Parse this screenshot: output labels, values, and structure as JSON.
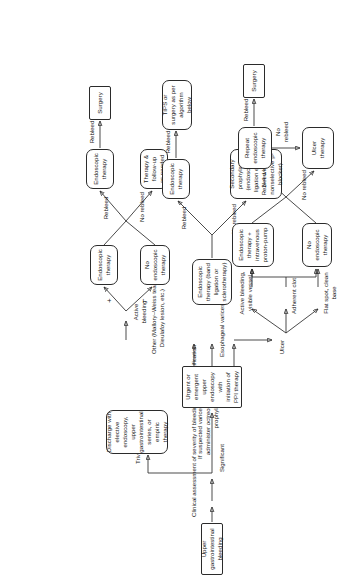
{
  "figure": {
    "orientation": "rotated-90-ccw"
  },
  "nodes": {
    "start": "Upper gastrointestinal bleeding",
    "discharge": "Discharge with elective endoscopy, upper gastrointestinal series, or empiric therapy",
    "endoscopy": "Urgent or emergent upper endoscopy with initiation of PPI therapy",
    "other_endo_therapy": "Endoscopic therapy",
    "other_no_endo_therapy": "No endoscopic therapy",
    "other_endo_therapy_2": "Endoscopic therapy",
    "other_therapy_followup": "Therapy & follow-up as needed",
    "other_surgery": "Surgery",
    "varices_endo_therapy": "Endoscopic therapy (band ligation or sclerotherapy)",
    "varices_secondary_prophylaxis": "Secondary prophylaxis (endoscopic ligation every 2–4 wks ± nonselective β-blocker)",
    "varices_endo_therapy_2": "Endoscopic therapy",
    "varices_tips": "TIPS or surgery as per algorithm below",
    "ulcer_endo_ppi": "Endoscopic therapy + intravenous proton-pump",
    "ulcer_no_endo": "No endoscopic therapy",
    "ulcer_repeat_endo": "Repeat endoscopic therapy",
    "ulcer_therapy": "Ulcer therapy",
    "ulcer_surgery": "Surgery"
  },
  "labels": {
    "clinical_assessment": "Clinical assessment of severity of bleeding and risk stratification",
    "trivial": "Trivial",
    "significant": "Significant",
    "if_suspected": "If suspected variceal hemorrhage, administer octreotide, antibiotic prophylaxis",
    "other_branch": "Other (Mallory–Weiss tear, Dieulafoy lesion, etc.)",
    "active_bleeding": "Active bleeding",
    "plus": "+",
    "minus": "−",
    "esophageal_varices": "Esophageal varices",
    "ulcer": "Ulcer",
    "active_bleeding_vessel": "Active bleeding, visible vessel",
    "adherent_clot": "Adherent clot",
    "flat_spot": "Flat spot, clean base",
    "rebleed": "Rebleed",
    "no_rebleed": "No rebleed",
    "rebleed_2": "Rebleed",
    "no_rebleed_2": "No rebleed",
    "varices_rebleed": "Rebleed",
    "varices_no_rebleed": "No rebleed",
    "varices_rebleed_2": "Rebleed",
    "ulcer_rebleed": "Rebleed",
    "ulcer_no_rebleed": "No rebleed",
    "ulcer_no_rebleed_2": "No rebleed",
    "ulcer_rebleed_2": "Rebleed"
  },
  "colors": {
    "stroke": "#2b2b2b",
    "text": "#1a1a1a",
    "background": "#ffffff"
  }
}
